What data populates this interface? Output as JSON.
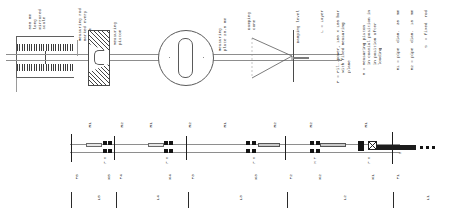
{
  "drawing": {
    "title": "Measuring rod assembly — sectional drawing",
    "sheet_bg": "#ffffff",
    "line_color": "#3a3a3a",
    "accent_color": "#1a1a1a"
  },
  "upper_assembly": {
    "scale_block": {
      "lines": [
        "500 mm",
        "long",
        "mirrored",
        "scale"
      ],
      "combined": "500 mm\nlong\nmirrored\nscale"
    },
    "callouts": [
      {
        "name": "measuring-rod-callout",
        "text": "Measuring rod\nmarked every\n50 cm"
      },
      {
        "name": "measuring-piston-callout",
        "text": "Measuring\npiston"
      },
      {
        "name": "measuring-plate-callout",
        "text": "Measuring\nplate 20.5 mm"
      },
      {
        "name": "damping-cone-callout",
        "text": "Damping\ncone"
      },
      {
        "name": "damping-level-callout",
        "text": "Damping level"
      }
    ]
  },
  "legend": {
    "entries": [
      {
        "key": "L",
        "text": "L = Layer"
      },
      {
        "key": "P",
        "text": "P = Pil.-power, 150 x 150 bar\n    with fixed measuring\n    plane"
      },
      {
        "key": "M",
        "text": "M = Measuring piston\n    in coaxial position in\n    in position after\n    loading"
      },
      {
        "key": "R1",
        "text": "R1 = pipe  diam.  35  mm"
      },
      {
        "key": "R2",
        "text": "R2 = pipe  diam.  18  mm"
      },
      {
        "key": "S",
        "text": "S  = fixed  rod"
      }
    ]
  },
  "lower_assembly": {
    "pipe_labels": [
      {
        "id": "p1",
        "label": "R1",
        "x": 87
      },
      {
        "id": "p2",
        "label": "R2",
        "x": 119
      },
      {
        "id": "p3",
        "label": "R1",
        "x": 148
      },
      {
        "id": "p4",
        "label": "R2",
        "x": 187
      },
      {
        "id": "p5",
        "label": "R1",
        "x": 222
      },
      {
        "id": "p6",
        "label": "R2",
        "x": 272
      },
      {
        "id": "p7",
        "label": "R2",
        "x": 308
      },
      {
        "id": "p8",
        "label": "R1",
        "x": 363
      }
    ],
    "station_labels": [
      {
        "id": "s1",
        "label": "F5",
        "x": 74
      },
      {
        "id": "s2",
        "label": "K5",
        "x": 106
      },
      {
        "id": "s3",
        "label": "F4",
        "x": 118
      },
      {
        "id": "s4",
        "label": "K4",
        "x": 167
      },
      {
        "id": "s5",
        "label": "F3",
        "x": 190
      },
      {
        "id": "s6",
        "label": "K3",
        "x": 253
      },
      {
        "id": "s7",
        "label": "F2",
        "x": 288
      },
      {
        "id": "s8",
        "label": "K2",
        "x": 317
      },
      {
        "id": "s9",
        "label": "K1",
        "x": 370
      },
      {
        "id": "s10",
        "label": "F1",
        "x": 395
      }
    ],
    "span_labels": [
      {
        "id": "L5",
        "label": "L5",
        "x": 96
      },
      {
        "id": "L4",
        "label": "L4",
        "x": 155
      },
      {
        "id": "L3",
        "label": "L3",
        "x": 238
      },
      {
        "id": "L2",
        "label": "L2",
        "x": 342
      },
      {
        "id": "L1",
        "label": "L1",
        "x": 425
      }
    ],
    "small_marks": [
      {
        "id": "m1",
        "label": "P M",
        "x": 103
      },
      {
        "id": "m2",
        "label": "P M",
        "x": 165
      },
      {
        "id": "m3",
        "label": "P M",
        "x": 252
      },
      {
        "id": "m4",
        "label": "M P",
        "x": 313
      },
      {
        "id": "m5",
        "label": "P M",
        "x": 367
      },
      {
        "id": "m6",
        "label": "S",
        "x": 398
      }
    ]
  }
}
